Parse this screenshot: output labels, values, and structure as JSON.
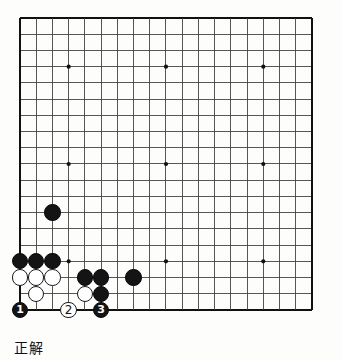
{
  "diagram": {
    "kind": "go-board-problem",
    "caption": "正解",
    "caption_meaning_label": "正解",
    "board": {
      "size": 19,
      "left": 20,
      "top": 18,
      "cell": 16.22,
      "line_color": "#3a3a3a",
      "border_color": "#111111",
      "star_color": "#111111",
      "background": "#fdfdfc",
      "star_points": [
        {
          "col": 4,
          "row": 4
        },
        {
          "col": 10,
          "row": 4
        },
        {
          "col": 16,
          "row": 4
        },
        {
          "col": 4,
          "row": 10
        },
        {
          "col": 10,
          "row": 10
        },
        {
          "col": 16,
          "row": 10
        },
        {
          "col": 4,
          "row": 16
        },
        {
          "col": 10,
          "row": 16
        },
        {
          "col": 16,
          "row": 16
        }
      ]
    },
    "stone_radius": 8.2,
    "stones": [
      {
        "id": "b-c3-r13",
        "color": "black",
        "col": 3,
        "row": 13,
        "label": ""
      },
      {
        "id": "b-c1-r16",
        "color": "black",
        "col": 1,
        "row": 16,
        "label": ""
      },
      {
        "id": "b-c2-r16",
        "color": "black",
        "col": 2,
        "row": 16,
        "label": ""
      },
      {
        "id": "b-c3-r16",
        "color": "black",
        "col": 3,
        "row": 16,
        "label": ""
      },
      {
        "id": "w-c1-r17",
        "color": "white",
        "col": 1,
        "row": 17,
        "label": ""
      },
      {
        "id": "w-c2-r17",
        "color": "white",
        "col": 2,
        "row": 17,
        "label": ""
      },
      {
        "id": "w-c3-r17",
        "color": "white",
        "col": 3,
        "row": 17,
        "label": ""
      },
      {
        "id": "b-c5-r17",
        "color": "black",
        "col": 5,
        "row": 17,
        "label": ""
      },
      {
        "id": "b-c6-r17",
        "color": "black",
        "col": 6,
        "row": 17,
        "label": ""
      },
      {
        "id": "b-c8-r17",
        "color": "black",
        "col": 8,
        "row": 17,
        "label": ""
      },
      {
        "id": "w-c2-r18",
        "color": "white",
        "col": 2,
        "row": 18,
        "label": ""
      },
      {
        "id": "w-c5-r18",
        "color": "white",
        "col": 5,
        "row": 18,
        "label": ""
      },
      {
        "id": "b-c6-r18",
        "color": "black",
        "col": 6,
        "row": 18,
        "label": ""
      },
      {
        "id": "b-move-1",
        "color": "black",
        "col": 1,
        "row": 19,
        "label": "1"
      },
      {
        "id": "w-move-2",
        "color": "white",
        "col": 4,
        "row": 19,
        "label": "2"
      },
      {
        "id": "b-move-3",
        "color": "black",
        "col": 6,
        "row": 19,
        "label": "3"
      }
    ],
    "move_sequence": [
      {
        "number": "1",
        "color": "black"
      },
      {
        "number": "2",
        "color": "white"
      },
      {
        "number": "3",
        "color": "black"
      }
    ]
  }
}
